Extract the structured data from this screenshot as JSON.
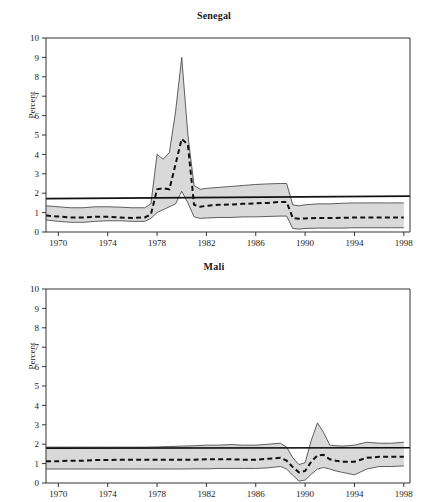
{
  "figure": {
    "ylabel": "Percent",
    "panels": [
      "Senegal",
      "Mali"
    ]
  },
  "chart_data": [
    {
      "type": "area",
      "title": "Senegal",
      "xlabel": "",
      "ylabel": "Percent",
      "xlim": [
        1969,
        1998.5
      ],
      "ylim": [
        0,
        10
      ],
      "yticks": [
        0,
        1,
        2,
        3,
        4,
        5,
        6,
        7,
        8,
        9,
        10
      ],
      "xticks": [
        1970,
        1974,
        1978,
        1982,
        1986,
        1990,
        1994,
        1998
      ],
      "grid": false,
      "legend": "none",
      "annotations": [
        "Shaded band = confidence interval",
        "Dashed line = point estimate",
        "Solid horizontal line = reference level"
      ],
      "x": [
        1969,
        1970,
        1971,
        1972,
        1973,
        1974,
        1975,
        1976,
        1977,
        1977.5,
        1978,
        1978.5,
        1979,
        1979.5,
        1980,
        1980.5,
        1981,
        1981.5,
        1982,
        1983,
        1984,
        1985,
        1986,
        1987,
        1988,
        1988.5,
        1989,
        1989.5,
        1990,
        1991,
        1992,
        1993,
        1994,
        1995,
        1996,
        1997,
        1998
      ],
      "series": [
        {
          "name": "upper_bound",
          "values": [
            1.35,
            1.3,
            1.25,
            1.25,
            1.3,
            1.3,
            1.28,
            1.25,
            1.25,
            1.45,
            4.0,
            3.75,
            4.1,
            6.2,
            9.0,
            5.0,
            2.4,
            2.2,
            2.25,
            2.3,
            2.35,
            2.4,
            2.45,
            2.48,
            2.5,
            2.5,
            1.4,
            1.35,
            1.4,
            1.45,
            1.45,
            1.48,
            1.5,
            1.5,
            1.5,
            1.5,
            1.5
          ]
        },
        {
          "name": "median",
          "values": [
            0.85,
            0.8,
            0.75,
            0.75,
            0.78,
            0.78,
            0.75,
            0.72,
            0.75,
            0.9,
            2.2,
            2.25,
            2.2,
            3.5,
            4.8,
            4.5,
            1.4,
            1.3,
            1.35,
            1.4,
            1.42,
            1.45,
            1.48,
            1.5,
            1.55,
            1.55,
            0.72,
            0.68,
            0.7,
            0.72,
            0.72,
            0.73,
            0.75,
            0.75,
            0.75,
            0.75,
            0.75
          ]
        },
        {
          "name": "lower_bound",
          "values": [
            0.62,
            0.55,
            0.5,
            0.5,
            0.55,
            0.58,
            0.58,
            0.55,
            0.55,
            0.7,
            1.0,
            1.15,
            1.3,
            1.45,
            2.1,
            1.5,
            0.78,
            0.7,
            0.72,
            0.75,
            0.75,
            0.78,
            0.78,
            0.8,
            0.82,
            0.82,
            0.18,
            0.15,
            0.18,
            0.2,
            0.2,
            0.2,
            0.22,
            0.22,
            0.22,
            0.22,
            0.22
          ]
        }
      ],
      "reference_line": {
        "name": "reference_level",
        "value_start": 1.72,
        "value_end": 1.85
      }
    },
    {
      "type": "area",
      "title": "Mali",
      "xlabel": "",
      "ylabel": "Percent",
      "xlim": [
        1969,
        1998.5
      ],
      "ylim": [
        0,
        10
      ],
      "yticks": [
        0,
        1,
        2,
        3,
        4,
        5,
        6,
        7,
        8,
        9,
        10
      ],
      "xticks": [
        1970,
        1974,
        1978,
        1982,
        1986,
        1990,
        1994,
        1998
      ],
      "grid": false,
      "legend": "none",
      "annotations": [
        "Shaded band = confidence interval",
        "Dashed line = point estimate",
        "Solid horizontal line = reference level"
      ],
      "x": [
        1969,
        1970,
        1971,
        1972,
        1973,
        1974,
        1975,
        1976,
        1977,
        1978,
        1979,
        1980,
        1981,
        1982,
        1983,
        1984,
        1985,
        1986,
        1987,
        1988,
        1988.5,
        1989,
        1989.5,
        1990,
        1990.5,
        1991,
        1991.5,
        1992,
        1992.5,
        1993,
        1994,
        1995,
        1996,
        1997,
        1998
      ],
      "series": [
        {
          "name": "upper_bound",
          "values": [
            1.85,
            1.85,
            1.85,
            1.85,
            1.85,
            1.85,
            1.85,
            1.85,
            1.85,
            1.86,
            1.88,
            1.9,
            1.92,
            1.95,
            1.95,
            1.98,
            1.95,
            1.95,
            2.0,
            2.05,
            1.85,
            1.3,
            0.95,
            1.05,
            2.2,
            3.1,
            2.6,
            1.95,
            1.92,
            1.9,
            1.95,
            2.1,
            2.05,
            2.05,
            2.1
          ]
        },
        {
          "name": "median",
          "values": [
            1.12,
            1.12,
            1.15,
            1.15,
            1.18,
            1.18,
            1.2,
            1.2,
            1.2,
            1.2,
            1.2,
            1.2,
            1.2,
            1.22,
            1.22,
            1.22,
            1.2,
            1.2,
            1.25,
            1.3,
            1.15,
            0.82,
            0.55,
            0.62,
            1.1,
            1.42,
            1.45,
            1.22,
            1.15,
            1.1,
            1.1,
            1.3,
            1.35,
            1.35,
            1.35
          ]
        },
        {
          "name": "lower_bound",
          "values": [
            0.72,
            0.72,
            0.72,
            0.72,
            0.72,
            0.72,
            0.72,
            0.72,
            0.72,
            0.72,
            0.72,
            0.72,
            0.73,
            0.73,
            0.75,
            0.75,
            0.75,
            0.75,
            0.78,
            0.85,
            0.72,
            0.4,
            0.1,
            0.15,
            0.45,
            0.72,
            0.8,
            0.72,
            0.62,
            0.55,
            0.42,
            0.72,
            0.85,
            0.85,
            0.88
          ]
        }
      ],
      "reference_line": {
        "name": "reference_level",
        "value_start": 1.8,
        "value_end": 1.82
      }
    }
  ]
}
